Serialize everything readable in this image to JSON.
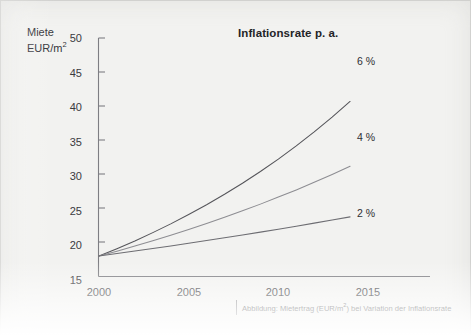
{
  "figure": {
    "title": "Inflationsrate p. a.",
    "y_axis_title_line1": "Miete",
    "y_axis_title_line2": "EUR/m",
    "y_axis_title_exponent": "2",
    "caption_prefix": "Abbildung: Mietertrag (EUR/m",
    "caption_exponent": "2",
    "caption_suffix": ") bei Variation der Inflationsrate"
  },
  "chart_data": {
    "type": "line",
    "title": "Inflationsrate p. a.",
    "xlabel": "",
    "ylabel": "Miete EUR/m²",
    "xlim": [
      1999,
      2016.5
    ],
    "ylim": [
      15,
      50
    ],
    "xticks": [
      2000,
      2005,
      2010,
      2015
    ],
    "yticks": [
      15,
      20,
      25,
      30,
      35,
      40,
      45,
      50
    ],
    "grid": false,
    "legend_position": "inline-right-of-curve-ends",
    "x": [
      2000,
      2001,
      2002,
      2003,
      2004,
      2005,
      2006,
      2007,
      2008,
      2009,
      2010,
      2011,
      2012,
      2013,
      2014
    ],
    "series": [
      {
        "name": "6 %",
        "label": "6 %",
        "color": "#55555a",
        "values": [
          18.0,
          19.08,
          20.22,
          21.44,
          22.72,
          24.09,
          25.53,
          27.06,
          28.69,
          30.41,
          32.23,
          34.17,
          36.22,
          38.39,
          40.69
        ]
      },
      {
        "name": "4 %",
        "label": "4 %",
        "color": "#8d8d92",
        "values": [
          18.0,
          18.72,
          19.47,
          20.25,
          21.06,
          21.9,
          22.78,
          23.69,
          24.64,
          25.62,
          26.65,
          27.71,
          28.82,
          29.98,
          31.17
        ]
      },
      {
        "name": "2 %",
        "label": "2 %",
        "color": "#6d6d72",
        "values": [
          18.0,
          18.36,
          18.73,
          19.1,
          19.48,
          19.87,
          20.27,
          20.68,
          21.09,
          21.51,
          21.94,
          22.38,
          22.83,
          23.29,
          23.75
        ]
      }
    ],
    "annotations": [
      {
        "text": "6 %",
        "x": 2015.2,
        "y": 46.5
      },
      {
        "text": "4 %",
        "x": 2015.2,
        "y": 35.6
      },
      {
        "text": "2 %",
        "x": 2015.2,
        "y": 24.6
      }
    ]
  },
  "axis": {
    "y_labels": [
      "50",
      "45",
      "40",
      "35",
      "30",
      "25",
      "20",
      "15"
    ],
    "x_labels": [
      "2000",
      "2005",
      "2010",
      "2015"
    ]
  }
}
